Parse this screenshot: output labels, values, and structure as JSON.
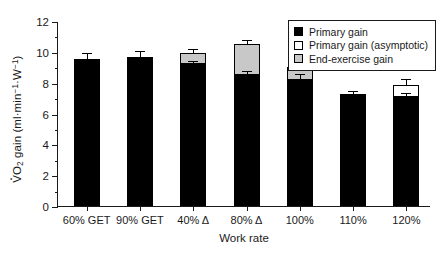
{
  "chart_data": {
    "type": "bar",
    "title": "",
    "xlabel": "Work rate",
    "ylabel": "VO2 gain (ml·min-1·W-1)",
    "ylim": [
      0,
      12
    ],
    "ytick_values": [
      0,
      2,
      4,
      6,
      8,
      10,
      12
    ],
    "ytick_labels": [
      "0",
      "2",
      "4",
      "6",
      "8",
      "10",
      "12"
    ],
    "yminor_values": [
      1,
      3,
      5,
      7,
      9,
      11
    ],
    "grid": false,
    "legend_position": "top-right",
    "categories": [
      "60% GET",
      "90% GET",
      "40% Δ",
      "80% Δ",
      "100%",
      "110%",
      "120%"
    ],
    "series": [
      {
        "name": "Primary gain",
        "color": "#000000",
        "values": [
          9.55,
          9.65,
          9.2,
          8.5,
          8.2,
          7.25,
          7.05
        ]
      },
      {
        "name": "Primary gain (asymptotic)",
        "color": "#ffffff",
        "values": [
          null,
          null,
          null,
          null,
          null,
          null,
          7.85
        ]
      },
      {
        "name": "End-exercise gain",
        "color": "#c8c8c8",
        "values": [
          null,
          null,
          9.9,
          10.5,
          9.0,
          null,
          null
        ]
      }
    ],
    "error_bars": [
      {
        "category": "60% GET",
        "value": 9.55,
        "err": 0.45
      },
      {
        "category": "90% GET",
        "value": 9.65,
        "err": 0.45
      },
      {
        "category": "40% Δ",
        "value": 9.9,
        "err": 0.35
      },
      {
        "category": "80% Δ",
        "value": 8.5,
        "err": 0.35
      },
      {
        "category": "100%",
        "value": 8.2,
        "err": 0.45
      },
      {
        "category": "110%",
        "value": 7.25,
        "err": 0.3
      },
      {
        "category": "120%",
        "value": 7.05,
        "err": 0.35
      }
    ],
    "extra_error_bars": [
      {
        "category": "40% Δ",
        "value": 9.2,
        "err": 0.3
      },
      {
        "category": "80% Δ",
        "value": 10.5,
        "err": 0.35
      },
      {
        "category": "100%",
        "value": 9.0,
        "err": 0.35
      },
      {
        "category": "120%",
        "value": 7.85,
        "err": 0.45
      }
    ]
  },
  "axes": {
    "y_title_main": "O",
    "y_title_sub": "2",
    "y_title_rest": " gain (ml",
    "y_title_unit_min": "min",
    "y_title_unit_min_exp": "−1",
    "y_title_unit_w": "W",
    "y_title_unit_w_exp": "−1",
    "y_title_close": ")",
    "x_title": "Work rate"
  },
  "legend": {
    "items": [
      {
        "label": "Primary gain",
        "swatch": "#000000"
      },
      {
        "label": "Primary gain (asymptotic)",
        "swatch": "#ffffff"
      },
      {
        "label": "End-exercise gain",
        "swatch": "#c8c8c8"
      }
    ]
  }
}
